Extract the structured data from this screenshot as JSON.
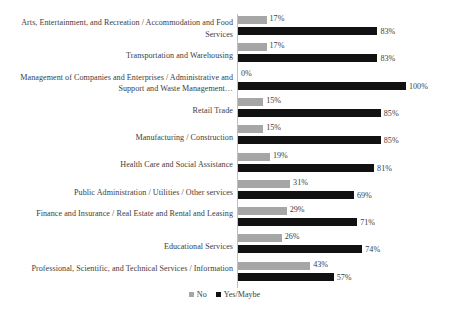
{
  "chart_data": {
    "type": "bar",
    "title": "",
    "subtitle": "",
    "xlabel": "",
    "ylabel": "",
    "orientation": "horizontal",
    "grid": false,
    "legend_position": "bottom-center",
    "xlim": [
      0,
      100
    ],
    "value_suffix": "%",
    "colors": {
      "no": "#a6a6a6",
      "yes": "#111111",
      "axis": "#bfbfbf",
      "text": "#3d3d3d",
      "background": "#ffffff"
    },
    "legend": [
      {
        "label": "No",
        "color": "#a6a6a6"
      },
      {
        "label": "Yes/Maybe",
        "color": "#111111"
      }
    ],
    "series": [
      {
        "name": "No",
        "values": [
          17,
          17,
          0,
          15,
          15,
          19,
          31,
          29,
          26,
          43
        ]
      },
      {
        "name": "Yes/Maybe",
        "values": [
          83,
          83,
          100,
          85,
          85,
          81,
          69,
          71,
          74,
          57
        ]
      }
    ],
    "categories": [
      "Arts, Entertainment, and Recreation / Accommodation and Food Services",
      "Transportation and Warehousing",
      "Management of Companies and Enterprises / Administrative and Support and Waste Management…",
      "Retail Trade",
      "Manufacturing / Construction",
      "Health Care and Social Assistance",
      "Public Administration / Utilities / Other services",
      "Finance and Insurance / Real Estate and Rental and Leasing",
      "Educational Services",
      "Professional, Scientific, and Technical Services / Information"
    ],
    "rows": [
      {
        "category": "Arts, Entertainment, and Recreation / Accommodation and Food Services",
        "no": 17,
        "yes": 83,
        "no_label": "17%",
        "yes_label": "83%"
      },
      {
        "category": "Transportation and Warehousing",
        "no": 17,
        "yes": 83,
        "no_label": "17%",
        "yes_label": "83%"
      },
      {
        "category": "Management of Companies and Enterprises / Administrative and Support and Waste Management…",
        "no": 0,
        "yes": 100,
        "no_label": "0%",
        "yes_label": "100%"
      },
      {
        "category": "Retail Trade",
        "no": 15,
        "yes": 85,
        "no_label": "15%",
        "yes_label": "85%"
      },
      {
        "category": "Manufacturing / Construction",
        "no": 15,
        "yes": 85,
        "no_label": "15%",
        "yes_label": "85%"
      },
      {
        "category": "Health Care and Social Assistance",
        "no": 19,
        "yes": 81,
        "no_label": "19%",
        "yes_label": "81%"
      },
      {
        "category": "Public Administration / Utilities / Other services",
        "no": 31,
        "yes": 69,
        "no_label": "31%",
        "yes_label": "69%"
      },
      {
        "category": "Finance and Insurance / Real Estate and Rental and Leasing",
        "no": 29,
        "yes": 71,
        "no_label": "29%",
        "yes_label": "71%"
      },
      {
        "category": "Educational Services",
        "no": 26,
        "yes": 74,
        "no_label": "26%",
        "yes_label": "74%"
      },
      {
        "category": "Professional, Scientific, and Technical Services / Information",
        "no": 43,
        "yes": 57,
        "no_label": "43%",
        "yes_label": "57%"
      }
    ]
  }
}
